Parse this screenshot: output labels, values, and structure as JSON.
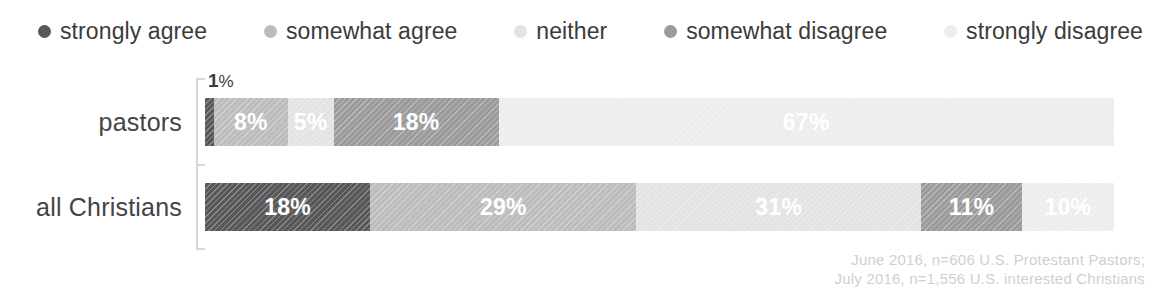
{
  "legend": {
    "items": [
      {
        "label": "strongly agree",
        "color": "#585858",
        "icon": "legend-dot-icon"
      },
      {
        "label": "somewhat agree",
        "color": "#bcbcbc",
        "icon": "legend-dot-icon"
      },
      {
        "label": "neither",
        "color": "#e3e3e3",
        "icon": "legend-dot-icon"
      },
      {
        "label": "somewhat disagree",
        "color": "#9b9b9b",
        "icon": "legend-dot-icon"
      },
      {
        "label": "strongly disagree",
        "color": "#ededed",
        "icon": "legend-dot-icon"
      }
    ]
  },
  "callout": {
    "value": "1",
    "unit": "%"
  },
  "footnote": {
    "line1": "June 2016, n=606 U.S. Protestant Pastors;",
    "line2": "July 2016, n=1,556 U.S. interested Christians"
  },
  "chart_data": {
    "type": "bar",
    "orientation": "horizontal",
    "stacked": true,
    "stack_total": 100,
    "title": "",
    "subtitle": "",
    "xlabel": "",
    "ylabel": "",
    "xlim": [
      0,
      100
    ],
    "grid": false,
    "legend_position": "top",
    "value_suffix": "%",
    "categories": [
      "pastors",
      "all Christians"
    ],
    "series": [
      {
        "name": "strongly agree",
        "color": "#585858",
        "values": [
          1,
          18
        ],
        "labels": [
          "1%",
          "18%"
        ],
        "label_inside": [
          false,
          true
        ]
      },
      {
        "name": "somewhat agree",
        "color": "#bcbcbc",
        "values": [
          8,
          29
        ],
        "labels": [
          "8%",
          "29%"
        ],
        "label_inside": [
          true,
          true
        ]
      },
      {
        "name": "neither",
        "color": "#e3e3e3",
        "values": [
          5,
          31
        ],
        "labels": [
          "5%",
          "31%"
        ],
        "label_inside": [
          true,
          true
        ]
      },
      {
        "name": "somewhat disagree",
        "color": "#9b9b9b",
        "values": [
          18,
          11
        ],
        "labels": [
          "18%",
          "11%"
        ],
        "label_inside": [
          true,
          true
        ]
      },
      {
        "name": "strongly disagree",
        "color": "#ededed",
        "values": [
          67,
          10
        ],
        "labels": [
          "67%",
          "10%"
        ],
        "label_inside": [
          true,
          true
        ]
      }
    ],
    "annotations": [
      {
        "text": "1%",
        "target": "pastors / strongly agree",
        "position": "above-bar-left"
      }
    ]
  }
}
